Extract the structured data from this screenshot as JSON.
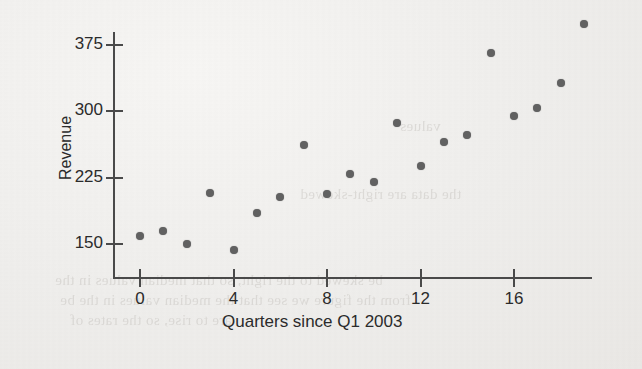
{
  "chart_data": {
    "type": "scatter",
    "title": "",
    "xlabel": "Quarters since Q1 2003",
    "ylabel": "Revenue",
    "xlim": [
      -1,
      20.5
    ],
    "ylim": [
      120,
      410
    ],
    "xticks": [
      0,
      4,
      8,
      12,
      16
    ],
    "yticks": [
      150,
      225,
      300,
      375
    ],
    "xtick_labels": [
      "0",
      "4",
      "8",
      "12",
      "16"
    ],
    "ytick_labels": [
      "150",
      "225",
      "300",
      "375"
    ],
    "grid": false,
    "legend": "none",
    "marker": {
      "shape": "circle",
      "color": "#616161",
      "size_px": 8
    },
    "series": [
      {
        "name": "Revenue",
        "x": [
          0,
          1,
          2,
          3,
          4,
          5,
          6,
          7,
          8,
          9,
          10,
          11,
          12,
          13,
          14,
          15,
          16,
          17,
          18,
          19
        ],
        "values": [
          159,
          165,
          150,
          208,
          143,
          185,
          203,
          262,
          206,
          229,
          220,
          287,
          238,
          265,
          273,
          366,
          295,
          304,
          332,
          399
        ]
      }
    ]
  },
  "page": {
    "background_color": "#f1efed",
    "ink_color": "#2b2b2b",
    "bleed_lines": [
      {
        "text": "the data are right-skewed",
        "x": 300,
        "y": 186
      },
      {
        "text": "be skewed to the right, so that median values in the",
        "x": 55,
        "y": 272
      },
      {
        "text": "from the figure we see that the median values in the be",
        "x": 60,
        "y": 292
      },
      {
        "text": "are to rise, so the rates of",
        "x": 70,
        "y": 312
      },
      {
        "text": "values",
        "x": 400,
        "y": 118
      }
    ]
  },
  "axes": {
    "x_axis_name": "horizontal-axis",
    "y_axis_name": "vertical-axis"
  }
}
